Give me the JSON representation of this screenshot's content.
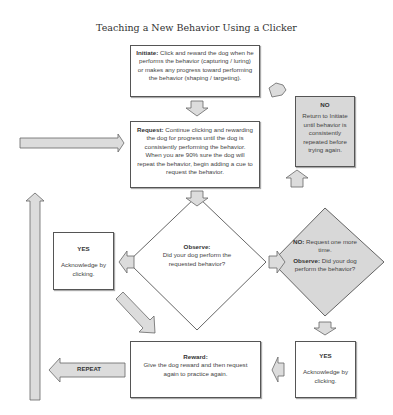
{
  "title": "Teaching a New Behavior Using a Clicker",
  "initiate": {
    "label": "Initiate:",
    "text": " Click and reward the dog when he performs the behavior (capturing / luring) or makes any progress toward performing the behavior (shaping / targeting)."
  },
  "request": {
    "label": "Request:",
    "text": " Continue clicking and rewarding the dog for progress until the dog is consistently performing the behavior. When you are 90% sure the dog will repeat the behavior, begin adding a cue to request the behavior."
  },
  "no_box": {
    "label": "NO",
    "text": "Return to Initiate until behavior is consistently repeated before trying again."
  },
  "observe": {
    "label": "Observe:",
    "text": "Did your dog perform the requested behavior?"
  },
  "no_observe": {
    "label1": "NO:",
    "text1": " Request one more  time.",
    "label2": "Observe:",
    "text2": " Did your dog perform the behavior?"
  },
  "yes_left": {
    "label": "YES",
    "text": "Acknowledge by clicking."
  },
  "yes_right": {
    "label": "YES",
    "text": "Acknowledge by clicking."
  },
  "reward": {
    "label": "Reward:",
    "text": "Give the dog reward and then request again to practice again."
  },
  "repeat_arrow": {
    "label": "REPEAT"
  },
  "colors": {
    "box_border": "#555555",
    "grey_fill": "#d8d8d8",
    "arrow_fill": "#dcdcdc",
    "arrow_stroke": "#666666"
  }
}
